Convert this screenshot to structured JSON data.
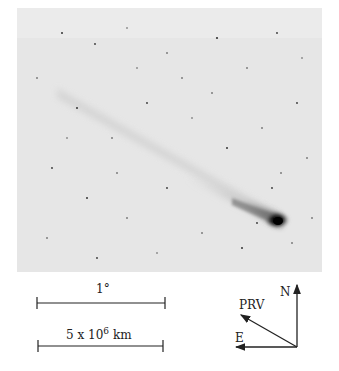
{
  "figure": {
    "background_color": "#e8e8e8",
    "comet_head": {
      "x": 277,
      "y": 220
    }
  },
  "scale_bars": [
    {
      "label": "1°"
    },
    {
      "label_base": "5 x 10",
      "label_exp": "6",
      "label_unit": "km"
    }
  ],
  "compass": {
    "north_label": "N",
    "east_label": "E",
    "prv_label": "PRV"
  }
}
